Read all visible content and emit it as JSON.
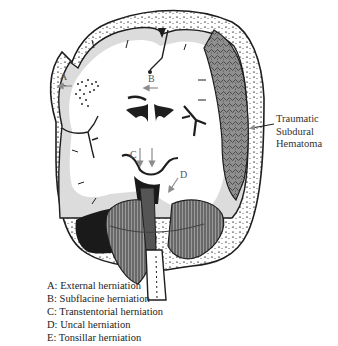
{
  "diagram": {
    "markers": [
      {
        "id": "A",
        "label": "A"
      },
      {
        "id": "B",
        "label": "B"
      },
      {
        "id": "C",
        "label": "C"
      },
      {
        "id": "D",
        "label": "D"
      }
    ],
    "callout": {
      "lines": [
        "Traumatic",
        "Subdural",
        "Hematoma"
      ]
    },
    "legend": [
      "A: External herniation",
      "B: Subflacine herniation",
      "C: Transtentorial herniation",
      "D: Uncal herniation",
      "E: Tonsillar herniation"
    ],
    "colors": {
      "outline": "#1e1e1e",
      "brain_white": "#ffffff",
      "grey_matter": "#d9d9d9",
      "hematoma": "#8a8a8a",
      "dark_space": "#1a1a1a",
      "arrow": "#8c8c8c"
    }
  }
}
